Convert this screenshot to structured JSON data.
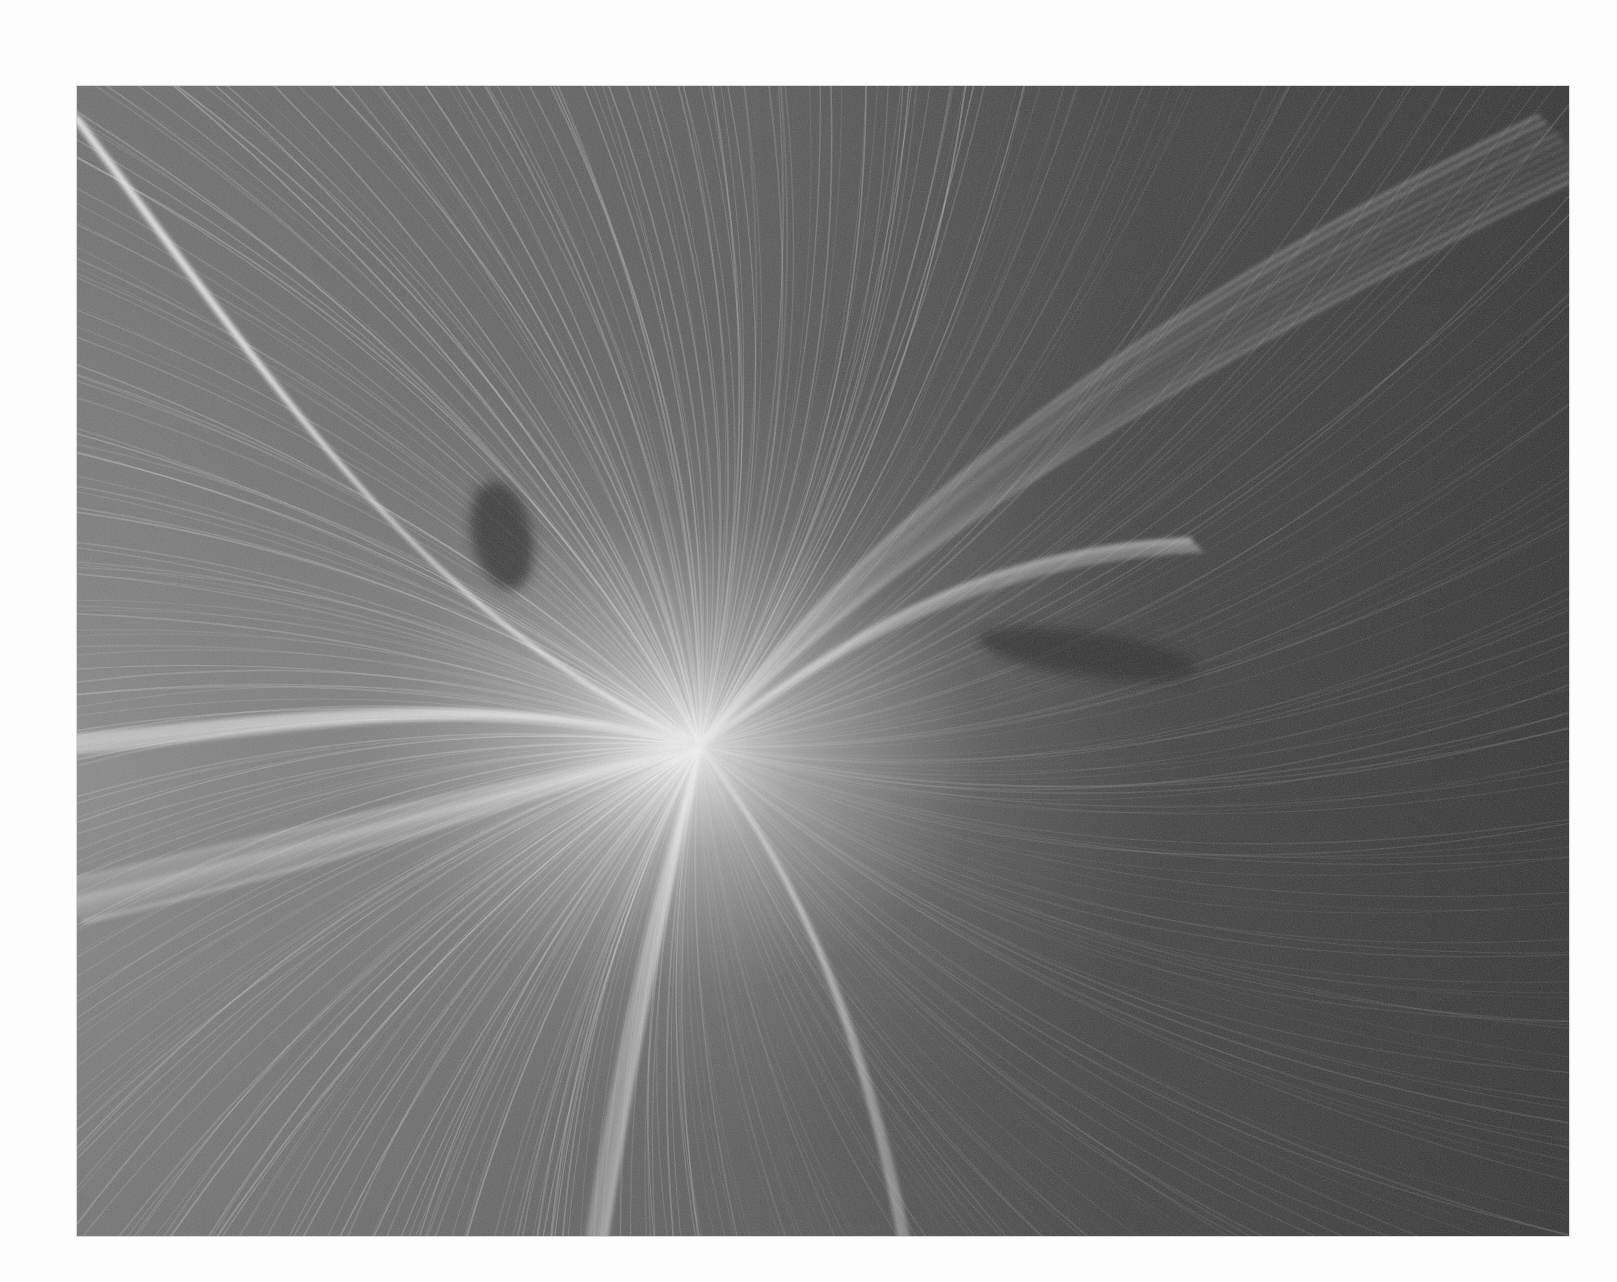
{
  "page": {
    "background_color": "#fdfdfd"
  },
  "artwork": {
    "kind": "grayscale flow-field streamline render",
    "frame": {
      "left": 77,
      "top": 86,
      "width": 1492,
      "height": 1150
    },
    "colors": {
      "base_left": "#6e6e6e",
      "base_center": "#5a5a5a",
      "base_right": "#383838",
      "highlight": "#ffffff",
      "dark_wake": "#2e2e2e"
    },
    "focal_point": {
      "x": 623,
      "y": 660
    },
    "dark_wakes": [
      {
        "x": 395,
        "y": 395,
        "w": 60,
        "h": 110,
        "rotate": -12
      },
      {
        "x": 900,
        "y": 545,
        "w": 220,
        "h": 45,
        "rotate": 8
      }
    ]
  }
}
